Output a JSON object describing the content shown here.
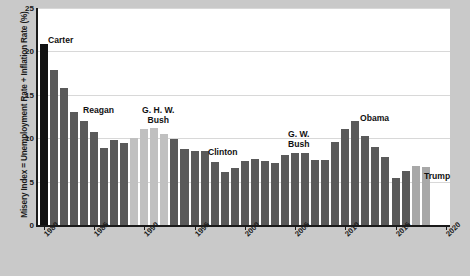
{
  "axes": {
    "ylabel": "Misery Index = Unemployment Rate + Inflation Rate (%)",
    "yticks": [
      "0",
      "5",
      "10",
      "15",
      "20",
      "25"
    ],
    "xticks": [
      "1980",
      "1985",
      "1990",
      "1995",
      "2000",
      "2005",
      "2010",
      "2015",
      "2020"
    ]
  },
  "colors": {
    "background": "#c9c9c9",
    "plot_background": "#ffffff",
    "gridline": "#d8d8d8",
    "axis": "#1a1a1a",
    "bar_dark": "#5a5a5a",
    "bar_black": "#111111",
    "bar_light": "#c0c0c0",
    "bar_light2": "#a8a8a8",
    "text": "#111111"
  },
  "annotations": [
    {
      "name": "carter",
      "text": "Carter",
      "x": 48,
      "y": 36
    },
    {
      "name": "reagan",
      "text": "Reagan",
      "x": 83,
      "y": 106
    },
    {
      "name": "ghwbush",
      "text": "G. H. W.\nBush",
      "x": 142,
      "y": 106
    },
    {
      "name": "clinton",
      "text": "Clinton",
      "x": 208,
      "y": 148
    },
    {
      "name": "gwbush",
      "text": "G. W.\nBush",
      "x": 288,
      "y": 130
    },
    {
      "name": "obama",
      "text": "Obama",
      "x": 360,
      "y": 114
    },
    {
      "name": "trump",
      "text": "Trump",
      "x": 424,
      "y": 172
    }
  ],
  "chart_data": {
    "type": "bar",
    "title": "",
    "xlabel": "",
    "ylabel": "Misery Index = Unemployment Rate + Inflation Rate (%)",
    "ylim": [
      0,
      25
    ],
    "grid": true,
    "legend": false,
    "categories": [
      "1980",
      "1981",
      "1982",
      "1983",
      "1984",
      "1985",
      "1986",
      "1987",
      "1988",
      "1989",
      "1990",
      "1991",
      "1992",
      "1993",
      "1994",
      "1995",
      "1996",
      "1997",
      "1998",
      "1999",
      "2000",
      "2001",
      "2002",
      "2003",
      "2004",
      "2005",
      "2006",
      "2007",
      "2008",
      "2009",
      "2010",
      "2011",
      "2012",
      "2013",
      "2014",
      "2015",
      "2016",
      "2017",
      "2018"
    ],
    "values": [
      20.8,
      17.9,
      15.8,
      13.0,
      12.0,
      10.7,
      8.9,
      9.8,
      9.5,
      10.0,
      11.1,
      11.2,
      10.5,
      9.9,
      8.7,
      8.5,
      8.5,
      7.3,
      6.1,
      6.6,
      7.4,
      7.6,
      7.4,
      7.2,
      8.1,
      8.3,
      8.3,
      7.5,
      7.5,
      9.6,
      11.1,
      12.0,
      10.2,
      9.0,
      7.8,
      5.4,
      6.2,
      6.8,
      6.7
    ],
    "bar_colors": [
      "black",
      "dark",
      "dark",
      "dark",
      "dark",
      "dark",
      "dark",
      "dark",
      "dark",
      "light",
      "light",
      "light",
      "light",
      "dark",
      "dark",
      "dark",
      "dark",
      "dark",
      "dark",
      "dark",
      "dark",
      "dark",
      "dark",
      "dark",
      "dark",
      "dark",
      "dark",
      "dark",
      "dark",
      "dark",
      "dark",
      "dark",
      "dark",
      "dark",
      "dark",
      "dark",
      "dark",
      "light2",
      "light2"
    ]
  }
}
